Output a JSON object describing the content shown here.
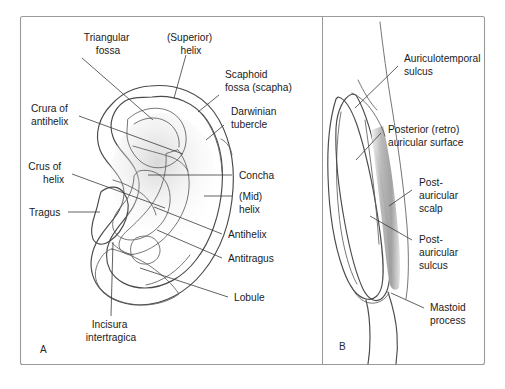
{
  "figure": {
    "background_color": "#ffffff",
    "frame_color": "#9a9a9a",
    "label_color": "#1b1b1b",
    "leader_color": "#3a3a3a",
    "outline_color": "#4a4a4a",
    "shade_light": "#f2f2f2",
    "shade_mid": "#d8d8d8",
    "shade_dark": "#a8a8a8"
  },
  "panels": [
    {
      "id": "A",
      "letter": "A",
      "caption": "Lateral view of the auricle",
      "labels": [
        {
          "id": "triangular-fossa",
          "lines": [
            "Triangular",
            "fossa"
          ],
          "align": "middle"
        },
        {
          "id": "superior-helix",
          "lines": [
            "(Superior)",
            "helix"
          ],
          "align": "middle"
        },
        {
          "id": "scaphoid-fossa",
          "lines": [
            "Scaphoid",
            "fossa (scapha)"
          ],
          "align": "start"
        },
        {
          "id": "darwinian-tubercle",
          "lines": [
            "Darwinian",
            "tubercle"
          ],
          "align": "start"
        },
        {
          "id": "crura-of-antihelix",
          "lines": [
            "Crura of",
            "antihelix"
          ],
          "align": "start"
        },
        {
          "id": "crus-of-helix",
          "lines": [
            "Crus of",
            "helix"
          ],
          "align": "middle"
        },
        {
          "id": "concha",
          "lines": [
            "Concha"
          ],
          "align": "start"
        },
        {
          "id": "mid-helix",
          "lines": [
            "(Mid)",
            "helix"
          ],
          "align": "start"
        },
        {
          "id": "tragus",
          "lines": [
            "Tragus"
          ],
          "align": "start"
        },
        {
          "id": "antihelix",
          "lines": [
            "Antihelix"
          ],
          "align": "start"
        },
        {
          "id": "antitragus",
          "lines": [
            "Antitragus"
          ],
          "align": "start"
        },
        {
          "id": "lobule",
          "lines": [
            "Lobule"
          ],
          "align": "start"
        },
        {
          "id": "incisura-intertragica",
          "lines": [
            "Incisura",
            "intertragica"
          ],
          "align": "middle"
        }
      ]
    },
    {
      "id": "B",
      "letter": "B",
      "caption": "Posterior (retroauricular) view",
      "labels": [
        {
          "id": "auriculotemporal-sulcus",
          "lines": [
            "Auriculotemporal",
            "sulcus"
          ],
          "align": "start"
        },
        {
          "id": "posterior-retro-auricular-surface",
          "lines": [
            "Posterior (retro)",
            "auricular surface"
          ],
          "align": "start"
        },
        {
          "id": "post-auricular-scalp",
          "lines": [
            "Post-",
            "auricular",
            "scalp"
          ],
          "align": "start"
        },
        {
          "id": "post-auricular-sulcus",
          "lines": [
            "Post-",
            "auricular",
            "sulcus"
          ],
          "align": "start"
        },
        {
          "id": "mastoid-process",
          "lines": [
            "Mastoid",
            "process"
          ],
          "align": "start"
        }
      ]
    }
  ]
}
